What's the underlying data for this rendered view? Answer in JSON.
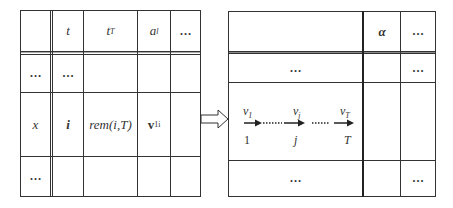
{
  "left_table": {
    "header": [
      "",
      "t",
      "t_T",
      "a_l",
      "…"
    ],
    "header_sub": {
      "t_T": "T",
      "a_l": "l"
    },
    "rows": [
      [
        "…",
        "…",
        "",
        "",
        ""
      ],
      [
        "x",
        "i",
        "rem(i,T)",
        "v1i",
        ""
      ],
      [
        "…",
        "",
        "",
        "",
        ""
      ]
    ],
    "cells": {
      "h1": "t",
      "h2_base": "t",
      "h2_sub": "T",
      "h3_base": "a",
      "h3_sub": "l",
      "h4": "…",
      "r1c0": "…",
      "r1c1": "…",
      "r2c0": "x",
      "r2c1": "i",
      "r2c2": "rem(i,T)",
      "r2c3_base": "v",
      "r2c3_sub": "1i",
      "r3c0": "…"
    }
  },
  "arrow": {
    "type": "hollow-right-arrow"
  },
  "right_table": {
    "header": {
      "c0": "",
      "c1": "α",
      "c2": "…"
    },
    "row1": {
      "c0": "…",
      "c2": "…"
    },
    "sequence": {
      "nodes": [
        {
          "label_base": "v",
          "label_sub": "1",
          "index": "1"
        },
        {
          "label_base": "v",
          "label_sub": "j",
          "index": "j"
        },
        {
          "label_base": "v",
          "label_sub": "T",
          "index": "T"
        }
      ],
      "connector": "……"
    },
    "row3": {
      "c0": "…",
      "c2": "…"
    }
  }
}
